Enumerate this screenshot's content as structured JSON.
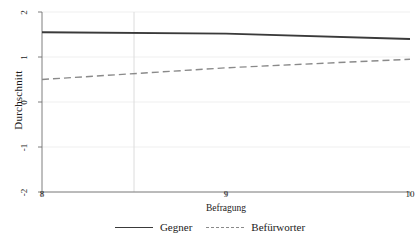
{
  "chart_data": {
    "type": "line",
    "title": "",
    "xlabel": "Befragung",
    "ylabel": "Durchschnitt",
    "xlim": [
      8,
      10
    ],
    "ylim": [
      -2,
      2
    ],
    "xticks": [
      8,
      9,
      10
    ],
    "xtick_labels": [
      "8",
      "9",
      "10"
    ],
    "yticks": [
      2,
      1,
      0,
      -1,
      -2
    ],
    "ytick_labels": [
      "2",
      "1",
      "0",
      "-1",
      "-2"
    ],
    "grid": true,
    "grid_color": "#e8e8e8",
    "vertical_reference_line_x": 8.5,
    "legend_position": "bottom",
    "x": [
      8,
      9,
      10
    ],
    "series": [
      {
        "name": "Gegner",
        "style": "solid",
        "color": "#3a3a3a",
        "values": [
          1.55,
          1.52,
          1.4
        ]
      },
      {
        "name": "Befürworter",
        "style": "dashed",
        "color": "#8a8a8a",
        "values": [
          0.5,
          0.76,
          0.95
        ]
      }
    ]
  },
  "legend": {
    "items": [
      {
        "label": "Gegner",
        "style": "solid"
      },
      {
        "label": "Befürworter",
        "style": "dashed"
      }
    ]
  }
}
